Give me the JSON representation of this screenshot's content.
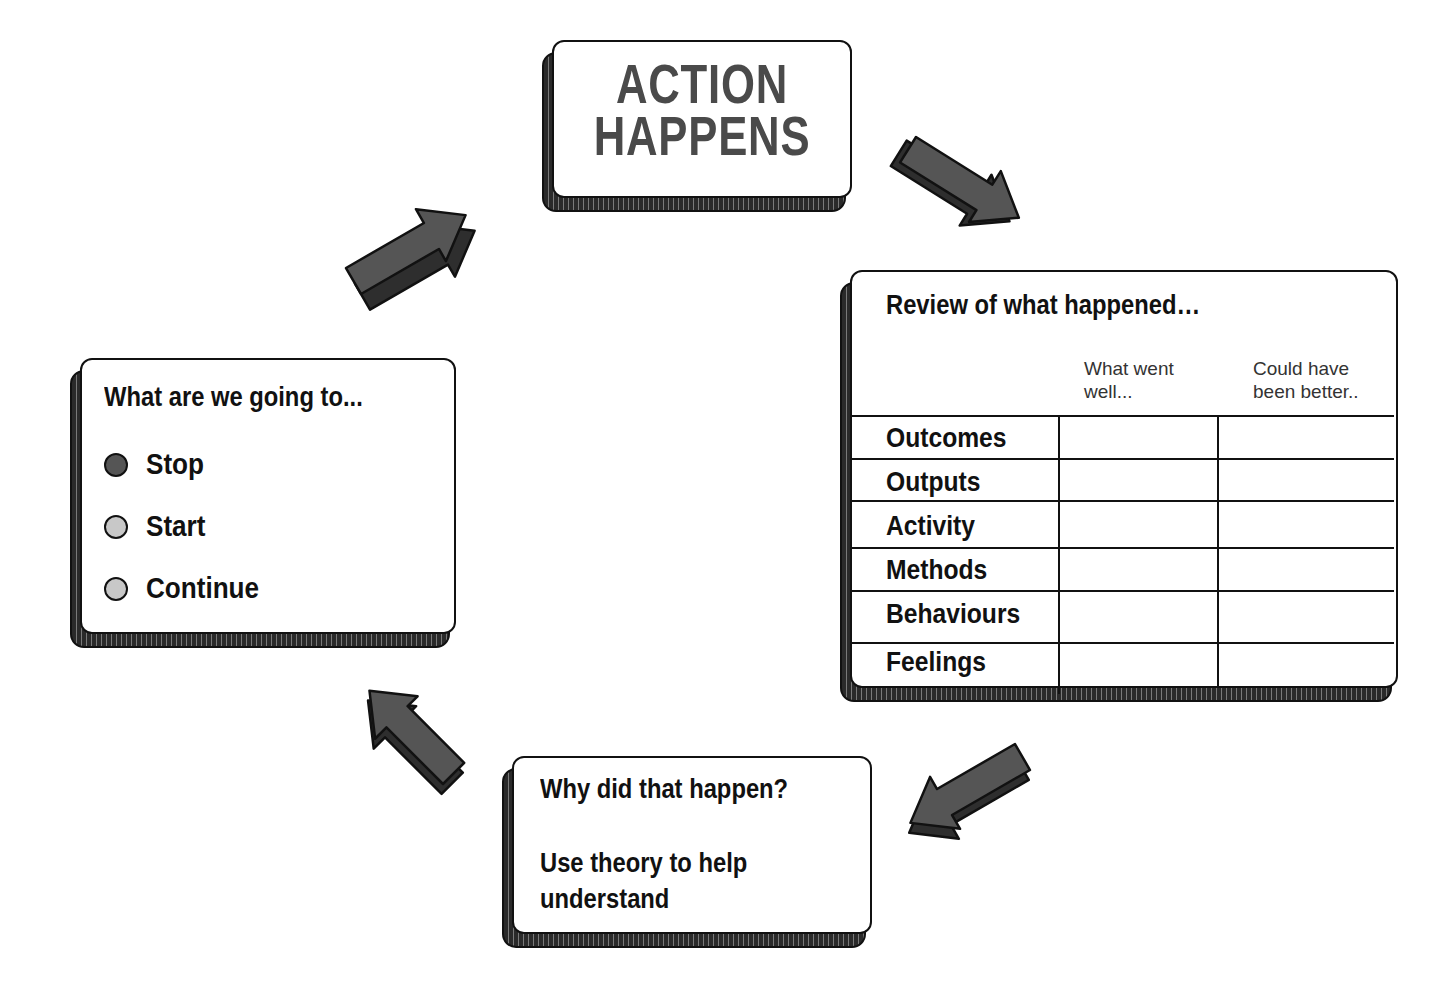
{
  "diagram": {
    "type": "cycle",
    "colors": {
      "arrow_fill": "#555555",
      "arrow_side": "#2e2e2e",
      "outline": "#111111",
      "title_text": "#4a4a4a",
      "dot_dark": "#555555",
      "dot_light": "#c8c8c8"
    }
  },
  "action_box": {
    "line1": "ACTION",
    "line2": "HAPPENS"
  },
  "review_box": {
    "title": "Review of what happened…",
    "columns": [
      "What went well...",
      "Could have been better.."
    ],
    "column_lines": [
      [
        "What went",
        "well..."
      ],
      [
        "Could have",
        "been better.."
      ]
    ],
    "rows": [
      "Outcomes",
      "Outputs",
      "Activity",
      "Methods",
      "Behaviours",
      "Feelings"
    ]
  },
  "why_box": {
    "line1": "Why did that happen?",
    "line2": "Use theory to help",
    "line3": "understand"
  },
  "plan_box": {
    "title": "What are we going to...",
    "options": [
      {
        "label": "Stop",
        "dot": "dark"
      },
      {
        "label": "Start",
        "dot": "light"
      },
      {
        "label": "Continue",
        "dot": "light"
      }
    ]
  },
  "arrows": [
    {
      "from": "plan_box",
      "to": "action_box",
      "direction": "up-right"
    },
    {
      "from": "action_box",
      "to": "review_box",
      "direction": "down-right"
    },
    {
      "from": "review_box",
      "to": "why_box",
      "direction": "down-left"
    },
    {
      "from": "why_box",
      "to": "plan_box",
      "direction": "up-left"
    }
  ]
}
